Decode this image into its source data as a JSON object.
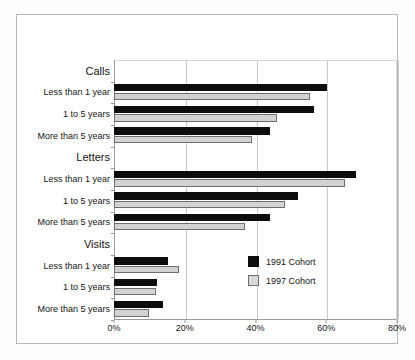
{
  "chart_data": {
    "type": "bar",
    "orientation": "horizontal",
    "title": "",
    "subtitle": "",
    "xlabel": "",
    "ylabel": "",
    "xlim": [
      0,
      80
    ],
    "xunit": "%",
    "xticks": [
      0,
      20,
      40,
      60,
      80
    ],
    "xtick_labels": [
      "0%",
      "20%",
      "40%",
      "60%",
      "80%"
    ],
    "grid": "vertical",
    "legend_position": "inside-right-lower",
    "groups": [
      {
        "name": "Calls",
        "categories": [
          "Less than 1 year",
          "1 to 5 years",
          "More than 5 years"
        ],
        "series": [
          {
            "name": "1991 Cohort",
            "values": [
              60.2,
              56.4,
              44.0
            ]
          },
          {
            "name": "1997 Cohort",
            "values": [
              55.4,
              46.0,
              39.0
            ]
          }
        ]
      },
      {
        "name": "Letters",
        "categories": [
          "Less than 1 year",
          "1 to 5 years",
          "More than 5 years"
        ],
        "series": [
          {
            "name": "1991 Cohort",
            "values": [
              68.3,
              51.9,
              44.2
            ]
          },
          {
            "name": "1997 Cohort",
            "values": [
              65.3,
              48.3,
              37.1
            ]
          }
        ]
      },
      {
        "name": "Visits",
        "categories": [
          "Less than 1 year",
          "1 to 5 years",
          "More than 5 years"
        ],
        "series": [
          {
            "name": "1991 Cohort",
            "values": [
              15.3,
              12.1,
              13.8
            ]
          },
          {
            "name": "1997 Cohort",
            "values": [
              18.3,
              11.9,
              9.8
            ]
          }
        ]
      }
    ],
    "legend": [
      {
        "label": "1991 Cohort",
        "color": "#0d0d0d"
      },
      {
        "label": "1997 Cohort",
        "color": "#d9d9d9"
      }
    ],
    "colors": {
      "series_1991": "#0d0d0d",
      "series_1997": "#d9d9d9",
      "series_1997_border": "#6e6e6e",
      "grid": "#c9c9c9",
      "axis": "#9a9a9a",
      "frame": "#b9b9b9",
      "text": "#151515",
      "background": "#ffffff"
    }
  }
}
